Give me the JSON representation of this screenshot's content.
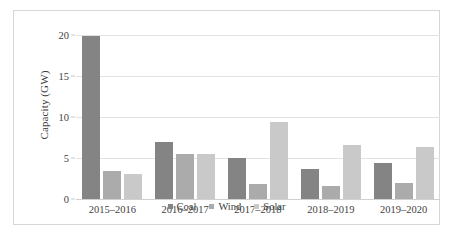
{
  "chart_data": {
    "type": "bar",
    "title": "",
    "xlabel": "",
    "ylabel": "Capacity (GW)",
    "categories": [
      "2015–2016",
      "2016–2017",
      "2017–2018",
      "2018–2019",
      "2019–2020"
    ],
    "series": [
      {
        "name": "Coal",
        "color": "#848484",
        "values": [
          19.9,
          7.0,
          5.0,
          3.6,
          4.4
        ]
      },
      {
        "name": "Wind",
        "color": "#ababab",
        "values": [
          3.4,
          5.5,
          1.8,
          1.6,
          2.0
        ]
      },
      {
        "name": "Solar",
        "color": "#c9c9c9",
        "values": [
          3.0,
          5.5,
          9.4,
          6.6,
          6.4
        ]
      }
    ],
    "ylim": [
      0,
      20
    ],
    "yticks": [
      0,
      5,
      10,
      15,
      20
    ],
    "ytick_labels": [
      "0",
      "5",
      "10",
      "15",
      "20"
    ],
    "grid": "horizontal",
    "legend_position": "bottom"
  },
  "legend": {
    "items": [
      {
        "label": "Coal"
      },
      {
        "label": "Wind"
      },
      {
        "label": "Solar"
      }
    ]
  },
  "axis": {
    "y_title": "Capacity (GW)"
  }
}
